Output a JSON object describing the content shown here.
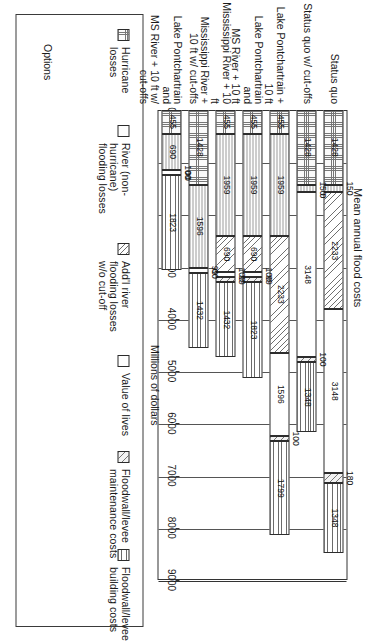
{
  "chart": {
    "title": "Mean annual flood costs",
    "xlabel": "Millions of dollars",
    "ylabel": "Options"
  },
  "legend": {
    "items": [
      {
        "label": "Hurricane losses",
        "swatch": "hurricane-swatch"
      },
      {
        "label": "River (non-hurricane)\nflooding losses",
        "swatch": "river-swatch"
      },
      {
        "label": "Add'l river\nflooding losses\nw/o cut-off",
        "swatch": "addl-river-swatch"
      },
      {
        "label": "Value of lives",
        "swatch": "value-of-lives-swatch"
      },
      {
        "label": "Floodwall/levee\nmaintenance costs",
        "swatch": "maintenance-swatch"
      },
      {
        "label": "Floodwall/levee\nbuilding costs",
        "swatch": "building-swatch"
      }
    ]
  },
  "axis": {
    "ticks": [
      "0",
      "1000",
      "2000",
      "3000",
      "4000",
      "5000",
      "6000",
      "7000",
      "8000",
      "9000"
    ]
  },
  "chart_data": {
    "type": "bar",
    "orientation": "horizontal-stacked",
    "title": "Mean annual flood costs",
    "xlabel": "Millions of dollars",
    "ylabel": "Options",
    "xlim": [
      0,
      9000
    ],
    "grid": true,
    "legend_position": "top",
    "categories": [
      "Status quo",
      "Status quo w/ cut-offs",
      "Lake Pontchartrain + 10 ft",
      "Lake Pontchartrain and\nMS River + 10 ft",
      "Mississippi River + 10 ft",
      "Mississippi River +\n10 ft w/ cut-offs",
      "Lake Pontchartrain and\nMS River + 10 ft w/ cut-offs"
    ],
    "series": [
      {
        "name": "Hurricane losses",
        "values": [
          1428,
          1428,
          455,
          455,
          455,
          1428,
          455
        ]
      },
      {
        "name": "River (non-hurricane) flooding losses",
        "values": [
          150,
          150,
          1959,
          1959,
          1959,
          1428,
          690
        ]
      },
      {
        "name": "Add'l river flooding losses w/o cut-off",
        "values": [
          2233,
          0,
          2233,
          690,
          690,
          0,
          0
        ]
      },
      {
        "name": "Value of lives",
        "values": [
          3148,
          3148,
          1596,
          100,
          100,
          1596,
          100
        ]
      },
      {
        "name": "Floodwall/levee maintenance costs",
        "values": [
          180,
          100,
          100,
          99,
          99,
          99,
          0
        ]
      },
      {
        "name": "Floodwall/levee building costs",
        "values": [
          1348,
          1348,
          1799,
          1823,
          1432,
          1432,
          1823
        ]
      }
    ],
    "bars": [
      {
        "category": "Status quo",
        "segments": [
          {
            "series": "Hurricane losses",
            "value": 1428
          },
          {
            "series": "River (non-hurricane) flooding losses",
            "value": 150
          },
          {
            "series": "Add'l river flooding losses w/o cut-off",
            "value": 2233
          },
          {
            "series": "Value of lives",
            "value": 3148
          },
          {
            "series": "Floodwall/levee maintenance costs",
            "value": 180
          },
          {
            "series": "Floodwall/levee building costs",
            "value": 1348
          }
        ],
        "total": 8487
      },
      {
        "category": "Status quo w/ cut-offs",
        "segments": [
          {
            "series": "Hurricane losses",
            "value": 1428
          },
          {
            "series": "River (non-hurricane) flooding losses",
            "value": 150
          },
          {
            "series": "Add'l river flooding losses w/o cut-off",
            "value": 0
          },
          {
            "series": "Value of lives",
            "value": 3148
          },
          {
            "series": "Floodwall/levee maintenance costs",
            "value": 100
          },
          {
            "series": "Floodwall/levee building costs",
            "value": 1348
          }
        ],
        "total": 6174
      },
      {
        "category": "Lake Pontchartrain + 10 ft",
        "segments": [
          {
            "series": "Hurricane losses",
            "value": 455
          },
          {
            "series": "River (non-hurricane) flooding losses",
            "value": 1959
          },
          {
            "series": "Add'l river flooding losses w/o cut-off",
            "value": 2233
          },
          {
            "series": "Value of lives",
            "value": 1596
          },
          {
            "series": "Floodwall/levee maintenance costs",
            "value": 100
          },
          {
            "series": "Floodwall/levee building costs",
            "value": 1799
          }
        ],
        "total": 8142
      },
      {
        "category": "Lake Pontchartrain and MS River + 10 ft",
        "segments": [
          {
            "series": "Hurricane losses",
            "value": 455
          },
          {
            "series": "River (non-hurricane) flooding losses",
            "value": 1959
          },
          {
            "series": "Add'l river flooding losses w/o cut-off",
            "value": 690
          },
          {
            "series": "Value of lives",
            "value": 100
          },
          {
            "series": "Floodwall/levee maintenance costs",
            "value": 99
          },
          {
            "series": "Floodwall/levee building costs",
            "value": 1823
          }
        ],
        "total": 5126
      },
      {
        "category": "Mississippi River + 10 ft",
        "segments": [
          {
            "series": "Hurricane losses",
            "value": 455
          },
          {
            "series": "River (non-hurricane) flooding losses",
            "value": 1959
          },
          {
            "series": "Add'l river flooding losses w/o cut-off",
            "value": 690
          },
          {
            "series": "Value of lives",
            "value": 100
          },
          {
            "series": "Floodwall/levee maintenance costs",
            "value": 99
          },
          {
            "series": "Floodwall/levee building costs",
            "value": 1432
          }
        ],
        "total": 4735
      },
      {
        "category": "Mississippi River + 10 ft w/ cut-offs",
        "segments": [
          {
            "series": "Hurricane losses",
            "value": 1428
          },
          {
            "series": "River (non-hurricane) flooding losses",
            "value": 1596
          },
          {
            "series": "Add'l river flooding losses w/o cut-off",
            "value": 0
          },
          {
            "series": "Value of lives",
            "value": 99
          },
          {
            "series": "Floodwall/levee maintenance costs",
            "value": 0
          },
          {
            "series": "Floodwall/levee building costs",
            "value": 1432
          }
        ],
        "total": 4555
      },
      {
        "category": "Lake Pontchartrain and MS River + 10 ft w/ cut-offs",
        "segments": [
          {
            "series": "Hurricane losses",
            "value": 455
          },
          {
            "series": "River (non-hurricane) flooding losses",
            "value": 690
          },
          {
            "series": "Add'l river flooding losses w/o cut-off",
            "value": 0
          },
          {
            "series": "Value of lives",
            "value": 100
          },
          {
            "series": "Floodwall/levee maintenance costs",
            "value": 0
          },
          {
            "series": "Floodwall/levee building costs",
            "value": 1823
          }
        ],
        "total": 3068
      }
    ]
  }
}
